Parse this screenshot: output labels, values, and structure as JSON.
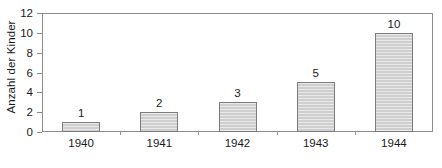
{
  "chart_data": {
    "type": "bar",
    "title": "",
    "xlabel": "",
    "ylabel": "Anzahl der Kinder",
    "categories": [
      "1940",
      "1941",
      "1942",
      "1943",
      "1944"
    ],
    "values": [
      1,
      2,
      3,
      5,
      10
    ],
    "data_labels": [
      "1",
      "2",
      "3",
      "5",
      "10"
    ],
    "ylim": [
      0,
      12
    ],
    "ytick_labels": [
      "0",
      "2",
      "4",
      "6",
      "8",
      "10",
      "12"
    ],
    "ytick_values": [
      0,
      2,
      4,
      6,
      8,
      10,
      12
    ],
    "grid": false,
    "legend": null,
    "bar_fill_color": "#cfcfcf",
    "bar_border_color": "#7d7d7d",
    "axis_color": "#8c8c8c",
    "text_color": "#1a1a1a",
    "background_color": "#ffffff"
  }
}
